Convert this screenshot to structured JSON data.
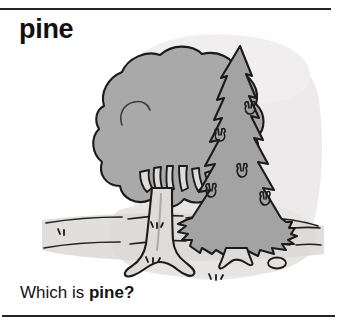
{
  "entry": {
    "headword": "pine",
    "caption_prefix": "Which is ",
    "caption_target": "pine",
    "caption_suffix": "?"
  },
  "illustration": {
    "alt": "A round leafy tree on the left and a tall pointed pine tree on the right, standing on ground",
    "deciduous_tree_name": "deciduous-tree",
    "pine_tree_name": "pine-tree",
    "background_wash_name": "background-wash",
    "ground_name": "ground-lines",
    "grass_name": "grass-tufts",
    "stone_name": "stone",
    "pinecone_name": "pinecone"
  },
  "colors": {
    "ink": "#1a1a1a",
    "canopy_gray": "#a9a9a9",
    "pine_gray": "#a2a2a2",
    "trunk_gray": "#d8d6d4",
    "wash_gray": "#e9e7e6",
    "ground_gray": "#d5d3d1",
    "paper": "#ffffff"
  },
  "rules": {
    "top_label": "top-divider",
    "bottom_label": "bottom-divider"
  }
}
